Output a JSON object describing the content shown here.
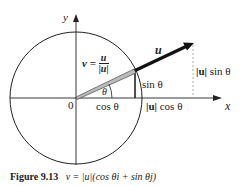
{
  "figure": {
    "axes": {
      "x_label": "x",
      "y_label": "y",
      "origin_label": "0"
    },
    "labels": {
      "u": "u",
      "v_eq": "v =",
      "v_frac_num": "u",
      "v_frac_den": "|u|",
      "theta": "θ",
      "sin_theta": "sin θ",
      "cos_theta": "cos θ",
      "u_abs_cos_bar": "|u|",
      "u_abs_cos_rest": " cos θ",
      "u_abs_sin_bar": "|u|",
      "u_abs_sin_rest": " sin θ"
    },
    "colors": {
      "stroke": "#222222",
      "unit_vector_fill": "#bbbbbb",
      "dashed": "#999999",
      "background": "#ffffff"
    }
  },
  "caption": {
    "number": "Figure 9.13",
    "formula": "v = |u|(cos θi + sin θj)"
  }
}
